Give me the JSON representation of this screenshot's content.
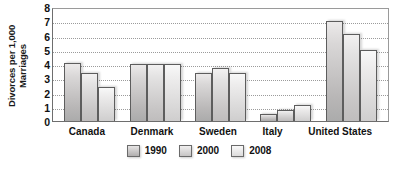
{
  "chart_data": {
    "type": "bar",
    "title": "",
    "xlabel": "",
    "ylabel_lines": [
      "Divorces per 1,000",
      "Marriages"
    ],
    "ylabel": "Divorces per 1,000 Marriages",
    "categories": [
      "Canada",
      "Denmark",
      "Sweden",
      "Italy",
      "United States"
    ],
    "series": [
      {
        "name": "1990",
        "values": [
          4.1,
          4.0,
          3.4,
          0.5,
          7.0
        ],
        "color": "#c3c1c1"
      },
      {
        "name": "2000",
        "values": [
          3.4,
          4.0,
          3.7,
          0.8,
          6.1
        ],
        "color": "#d5d3d3"
      },
      {
        "name": "2008",
        "values": [
          2.4,
          4.0,
          3.4,
          1.1,
          5.0
        ],
        "color": "#e6e5e5"
      }
    ],
    "ylim": [
      0,
      8
    ],
    "yticks": [
      8,
      7,
      6,
      5,
      4,
      3,
      2,
      1,
      0
    ],
    "grid": true,
    "legend_position": "bottom-center"
  }
}
